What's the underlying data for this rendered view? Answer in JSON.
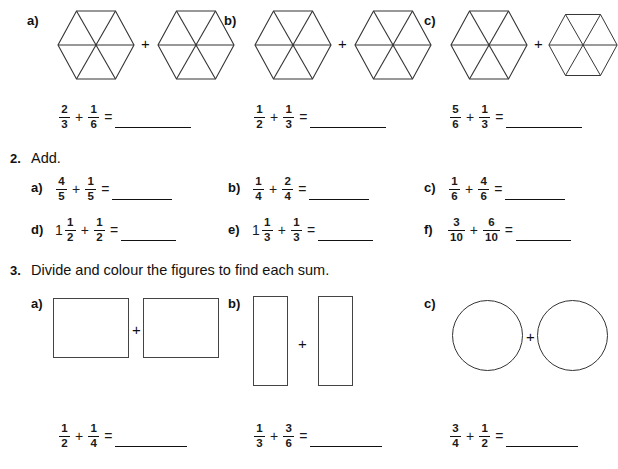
{
  "worksheet": {
    "questions": [
      {
        "number": "",
        "prompt": "",
        "parts": [
          {
            "label": "a)",
            "expr": {
              "left": {
                "num": "2",
                "den": "3"
              },
              "right": {
                "num": "1",
                "den": "6"
              },
              "op": "+",
              "eq": "="
            }
          },
          {
            "label": "b)",
            "expr": {
              "left": {
                "num": "1",
                "den": "2"
              },
              "right": {
                "num": "1",
                "den": "3"
              },
              "op": "+",
              "eq": "="
            }
          },
          {
            "label": "c)",
            "expr": {
              "left": {
                "num": "5",
                "den": "6"
              },
              "right": {
                "num": "1",
                "den": "3"
              },
              "op": "+",
              "eq": "="
            }
          }
        ]
      },
      {
        "number": "2.",
        "prompt": "Add.",
        "parts": [
          {
            "label": "a)",
            "expr": {
              "left": {
                "whole": "",
                "num": "4",
                "den": "5"
              },
              "right": {
                "whole": "",
                "num": "1",
                "den": "5"
              },
              "op": "+",
              "eq": "="
            }
          },
          {
            "label": "b)",
            "expr": {
              "left": {
                "whole": "",
                "num": "1",
                "den": "4"
              },
              "right": {
                "whole": "",
                "num": "2",
                "den": "4"
              },
              "op": "+",
              "eq": "="
            }
          },
          {
            "label": "c)",
            "expr": {
              "left": {
                "whole": "",
                "num": "1",
                "den": "6"
              },
              "right": {
                "whole": "",
                "num": "4",
                "den": "6"
              },
              "op": "+",
              "eq": "="
            }
          },
          {
            "label": "d)",
            "expr": {
              "left": {
                "whole": "1",
                "num": "1",
                "den": "2"
              },
              "right": {
                "whole": "",
                "num": "1",
                "den": "2"
              },
              "op": "+",
              "eq": "="
            }
          },
          {
            "label": "e)",
            "expr": {
              "left": {
                "whole": "1",
                "num": "1",
                "den": "3"
              },
              "right": {
                "whole": "",
                "num": "1",
                "den": "3"
              },
              "op": "+",
              "eq": "="
            }
          },
          {
            "label": "f)",
            "expr": {
              "left": {
                "whole": "",
                "num": "3",
                "den": "10"
              },
              "right": {
                "whole": "",
                "num": "6",
                "den": "10"
              },
              "op": "+",
              "eq": "="
            }
          }
        ]
      },
      {
        "number": "3.",
        "prompt": "Divide and colour the figures to find each sum.",
        "parts": [
          {
            "label": "a)",
            "shape": "square",
            "expr": {
              "left": {
                "num": "1",
                "den": "2"
              },
              "right": {
                "num": "1",
                "den": "4"
              },
              "op": "+",
              "eq": "="
            }
          },
          {
            "label": "b)",
            "shape": "tall-rectangle",
            "expr": {
              "left": {
                "num": "1",
                "den": "3"
              },
              "right": {
                "num": "3",
                "den": "6"
              },
              "op": "+",
              "eq": "="
            }
          },
          {
            "label": "c)",
            "shape": "circle",
            "expr": {
              "left": {
                "num": "3",
                "den": "4"
              },
              "right": {
                "num": "1",
                "den": "2"
              },
              "op": "+",
              "eq": "="
            }
          }
        ]
      }
    ],
    "plus_symbol": "+"
  }
}
